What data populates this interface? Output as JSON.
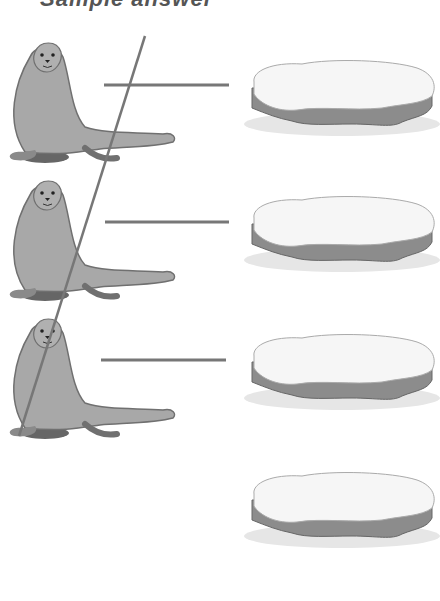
{
  "worksheet": {
    "title": "Sample answer",
    "rows": [
      {
        "left": "seal",
        "right": "ice-floe",
        "connected": true
      },
      {
        "left": "seal",
        "right": "ice-floe",
        "connected": true
      },
      {
        "left": "seal",
        "right": "ice-floe",
        "connected": true
      },
      {
        "left": "",
        "right": "ice-floe",
        "connected": false
      }
    ],
    "line_color": "#777777",
    "seal_color": "#a8a8a8",
    "ice_color": "#f4f4f4"
  }
}
